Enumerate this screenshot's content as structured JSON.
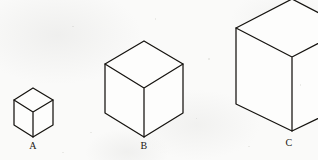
{
  "figure": {
    "background_color": "#f9f9f8",
    "line_color": "#15130f",
    "face_color": "#fdfdfc",
    "canvas": {
      "width": 318,
      "height": 160
    }
  },
  "cubes": [
    {
      "label": "A",
      "label_x": 33,
      "label_y": 140,
      "size": "small",
      "clipped": false,
      "geometry": {
        "top_apex": [
          33,
          88
        ],
        "left_top": [
          14,
          100
        ],
        "right_top": [
          53,
          100
        ],
        "center_top": [
          33,
          112
        ],
        "left_bottom": [
          14,
          125
        ],
        "right_bottom": [
          53,
          125
        ],
        "bottom_apex": [
          33,
          137
        ]
      }
    },
    {
      "label": "B",
      "label_x": 144,
      "label_y": 140,
      "size": "medium",
      "clipped": false,
      "geometry": {
        "top_apex": [
          144,
          41
        ],
        "left_top": [
          105,
          64
        ],
        "right_top": [
          183,
          64
        ],
        "center_top": [
          144,
          88
        ],
        "left_bottom": [
          105,
          113
        ],
        "right_bottom": [
          183,
          113
        ],
        "bottom_apex": [
          144,
          137
        ]
      }
    },
    {
      "label": "C",
      "label_x": 289,
      "label_y": 137,
      "size": "large",
      "clipped": true,
      "geometry": {
        "top_apex": [
          292,
          -1
        ],
        "left_top": [
          236,
          28
        ],
        "right_top": [
          348,
          28
        ],
        "center_top": [
          292,
          57
        ],
        "left_bottom": [
          236,
          104
        ],
        "right_bottom": [
          348,
          104
        ],
        "bottom_apex": [
          292,
          131
        ]
      }
    }
  ]
}
